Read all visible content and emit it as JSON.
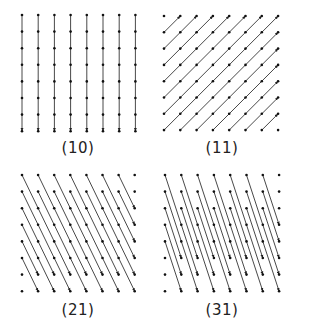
{
  "figure": {
    "width": 293,
    "height": 327,
    "line_color": "#333333",
    "point_color": "#111111",
    "background": "#ffffff",
    "grid_points_per_side": 8,
    "panels": [
      {
        "id": "p10",
        "label": "(10)",
        "indices": [
          1,
          0
        ],
        "origin": [
          22,
          15
        ],
        "spacing": [
          16.2,
          16.6
        ],
        "label_pos": [
          78,
          153
        ]
      },
      {
        "id": "p11",
        "label": "(11)",
        "indices": [
          1,
          1
        ],
        "origin": [
          164,
          16
        ],
        "spacing": [
          16.3,
          16.3
        ],
        "label_pos": [
          222,
          153
        ]
      },
      {
        "id": "p21",
        "label": "(21)",
        "indices": [
          2,
          1
        ],
        "origin": [
          22,
          175
        ],
        "spacing": [
          16.1,
          16.6
        ],
        "label_pos": [
          78,
          315
        ]
      },
      {
        "id": "p31",
        "label": "(31)",
        "indices": [
          3,
          1
        ],
        "origin": [
          165,
          175
        ],
        "spacing": [
          16.3,
          16.6
        ],
        "label_pos": [
          222,
          315
        ]
      }
    ]
  }
}
